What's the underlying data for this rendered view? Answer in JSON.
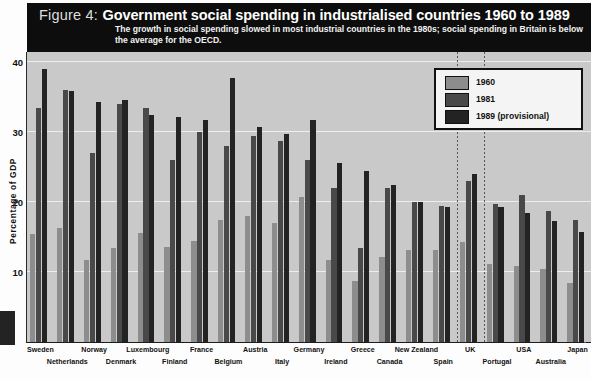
{
  "figure": {
    "label": "Figure 4:",
    "title": "Government social spending in industrialised countries 1960 to 1989",
    "subtitle": "The growth in social spending slowed in most industrial countries in the 1980s; social spending in Britain is below the average for the OECD."
  },
  "legend": {
    "items": [
      {
        "label": "1960",
        "color": "#8d8d8d"
      },
      {
        "label": "1981",
        "color": "#494949"
      },
      {
        "label": "1989 (provisional)",
        "color": "#232323"
      }
    ]
  },
  "colors": {
    "band_background": "#0d0d0d",
    "plot_background": "#c9c9c9",
    "gridline": "#ededed",
    "series_1960": "#8d8d8d",
    "series_1981": "#494949",
    "series_1989": "#232323"
  },
  "chart_data": {
    "type": "bar",
    "title": "Government social spending in industrialised countries 1960 to 1989",
    "xlabel": "",
    "ylabel": "Percentage of GDP",
    "ylim": [
      0,
      41.5
    ],
    "yticks": [
      10,
      20,
      30,
      40
    ],
    "grid": true,
    "legend_position": "top-right",
    "highlight_marker": "dotted vertical lines bracketing the UK group",
    "categories": [
      "Sweden",
      "Netherlands",
      "Norway",
      "Denmark",
      "Luxembourg",
      "Finland",
      "France",
      "Belgium",
      "Austria",
      "Italy",
      "Germany",
      "Ireland",
      "Greece",
      "Canada",
      "New Zealand",
      "Spain",
      "UK",
      "Portugal",
      "USA",
      "Australia",
      "Japan"
    ],
    "series": [
      {
        "name": "1960",
        "values": [
          15.5,
          16.3,
          11.8,
          13.5,
          15.6,
          13.6,
          14.4,
          17.4,
          18.1,
          17.0,
          20.7,
          11.8,
          8.7,
          12.1,
          13.1,
          13.2,
          14.3,
          11.1,
          10.9,
          10.4,
          8.5
        ]
      },
      {
        "name": "1981",
        "values": [
          33.5,
          36.1,
          27.1,
          34.0,
          33.5,
          26.1,
          30.0,
          28.0,
          29.5,
          28.7,
          26.0,
          22.0,
          13.4,
          22.0,
          20.0,
          19.4,
          23.0,
          19.7,
          21.0,
          18.7,
          17.5
        ]
      },
      {
        "name": "1989 (provisional)",
        "values": [
          39.1,
          35.9,
          34.3,
          34.6,
          32.5,
          32.2,
          31.8,
          37.8,
          30.8,
          29.8,
          31.7,
          25.6,
          24.5,
          22.5,
          20.0,
          19.3,
          24.0,
          19.3,
          18.5,
          17.3,
          15.8
        ]
      }
    ]
  }
}
